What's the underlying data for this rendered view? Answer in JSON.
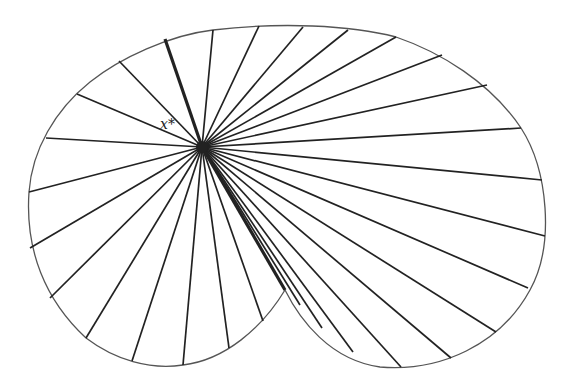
{
  "diagram": {
    "type": "star-shaped region with rays from an interior point",
    "center_label": "x*",
    "center": [
      202,
      147
    ],
    "colors": {
      "stroke": "#222222",
      "boundary": "#555555",
      "background": "#ffffff"
    },
    "thick_rays": [
      [
        165,
        39
      ],
      [
        285,
        290
      ]
    ],
    "rays": [
      [
        165,
        39
      ],
      [
        213,
        30
      ],
      [
        259,
        26
      ],
      [
        303,
        27
      ],
      [
        348,
        30
      ],
      [
        396,
        37
      ],
      [
        442,
        55
      ],
      [
        487,
        85
      ],
      [
        521,
        128
      ],
      [
        542,
        180
      ],
      [
        545,
        236
      ],
      [
        528,
        288
      ],
      [
        496,
        332
      ],
      [
        451,
        358
      ],
      [
        401,
        367
      ],
      [
        353,
        352
      ],
      [
        322,
        328
      ],
      [
        300,
        305
      ],
      [
        285,
        290
      ],
      [
        263,
        321
      ],
      [
        229,
        348
      ],
      [
        183,
        365
      ],
      [
        132,
        361
      ],
      [
        86,
        338
      ],
      [
        50,
        298
      ],
      [
        30,
        248
      ],
      [
        29,
        192
      ],
      [
        46,
        138
      ],
      [
        77,
        94
      ],
      [
        119,
        61
      ]
    ]
  }
}
